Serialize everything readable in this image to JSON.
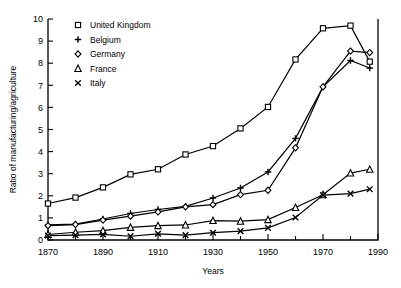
{
  "chart_data": {
    "type": "line",
    "title": "",
    "xlabel": "Years",
    "ylabel": "Ratio of manufacturing/agriculture",
    "xlim": [
      1870,
      1990
    ],
    "ylim": [
      0,
      10
    ],
    "xticks": [
      1870,
      1890,
      1910,
      1930,
      1950,
      1970,
      1990
    ],
    "xticklabels": [
      "1870",
      "1890",
      "1910",
      "1930",
      "1950",
      "1970",
      "1990"
    ],
    "xminorticks": [
      1880,
      1900,
      1920,
      1940,
      1960,
      1980
    ],
    "yticks": [
      0,
      1,
      2,
      3,
      4,
      5,
      6,
      7,
      8,
      9,
      10
    ],
    "yticklabels": [
      "0",
      "1",
      "2",
      "3",
      "4",
      "5",
      "6",
      "7",
      "8",
      "9",
      "10"
    ],
    "grid": false,
    "legend_position": "top-left",
    "series": [
      {
        "name": "United Kingdom",
        "marker": "square",
        "x": [
          1870,
          1880,
          1890,
          1900,
          1910,
          1920,
          1930,
          1940,
          1950,
          1960,
          1970,
          1980,
          1987
        ],
        "values": [
          1.65,
          1.92,
          2.38,
          2.97,
          3.2,
          3.87,
          4.25,
          5.05,
          6.02,
          8.17,
          9.58,
          9.7,
          8.07
        ]
      },
      {
        "name": "Belgium",
        "marker": "plus",
        "x": [
          1870,
          1880,
          1890,
          1900,
          1910,
          1920,
          1930,
          1940,
          1950,
          1960,
          1970,
          1980,
          1987
        ],
        "values": [
          0.68,
          0.72,
          0.95,
          1.2,
          1.38,
          1.52,
          1.9,
          2.35,
          3.08,
          4.6,
          6.93,
          8.12,
          7.78
        ]
      },
      {
        "name": "Germany",
        "marker": "diamond",
        "x": [
          1870,
          1880,
          1890,
          1900,
          1910,
          1920,
          1930,
          1940,
          1950,
          1960,
          1970,
          1980,
          1987
        ],
        "values": [
          0.65,
          0.7,
          0.9,
          1.08,
          1.27,
          1.5,
          1.6,
          2.05,
          2.25,
          4.17,
          6.93,
          8.55,
          8.48
        ]
      },
      {
        "name": "France",
        "marker": "triangle",
        "x": [
          1870,
          1880,
          1890,
          1900,
          1910,
          1920,
          1930,
          1940,
          1950,
          1960,
          1970,
          1980,
          1987
        ],
        "values": [
          0.25,
          0.35,
          0.42,
          0.57,
          0.65,
          0.68,
          0.88,
          0.85,
          0.92,
          1.47,
          2.05,
          3.03,
          3.2
        ]
      },
      {
        "name": "Italy",
        "marker": "cross",
        "x": [
          1870,
          1880,
          1890,
          1900,
          1910,
          1920,
          1930,
          1940,
          1950,
          1960,
          1970,
          1980,
          1987
        ],
        "values": [
          0.2,
          0.22,
          0.25,
          0.17,
          0.28,
          0.22,
          0.33,
          0.4,
          0.55,
          1.02,
          2.03,
          2.1,
          2.3
        ]
      }
    ]
  },
  "legend": {
    "items": [
      {
        "label": "United Kingdom",
        "marker": "square"
      },
      {
        "label": "Belgium",
        "marker": "plus"
      },
      {
        "label": "Germany",
        "marker": "diamond"
      },
      {
        "label": "France",
        "marker": "triangle"
      },
      {
        "label": "Italy",
        "marker": "cross"
      }
    ]
  }
}
